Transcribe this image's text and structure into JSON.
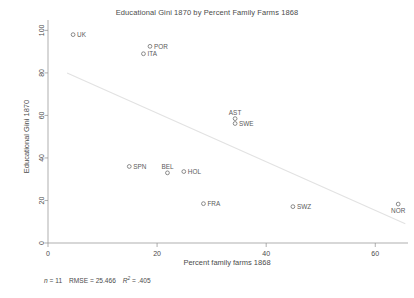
{
  "chart_data": {
    "type": "scatter",
    "title": "Educational Gini 1870 by Percent Family Farms 1868",
    "xlabel": "Percent family farms 1868",
    "ylabel": "Educational Gini 1870",
    "xlim": [
      0,
      66
    ],
    "ylim": [
      0,
      103
    ],
    "xticks": [
      0,
      20,
      40,
      60
    ],
    "yticks": [
      0,
      20,
      40,
      60,
      80,
      100
    ],
    "grid": false,
    "legend": "none",
    "marker": "open-circle",
    "points": [
      {
        "label": "UK",
        "x": 4.6,
        "y": 98.0,
        "label_pos": "right"
      },
      {
        "label": "POR",
        "x": 18.7,
        "y": 92.5,
        "label_pos": "right"
      },
      {
        "label": "ITA",
        "x": 17.5,
        "y": 89.0,
        "label_pos": "right"
      },
      {
        "label": "AST",
        "x": 34.3,
        "y": 58.5,
        "label_pos": "above"
      },
      {
        "label": "SWE",
        "x": 34.3,
        "y": 56.2,
        "label_pos": "right"
      },
      {
        "label": "SPN",
        "x": 14.9,
        "y": 36.0,
        "label_pos": "right"
      },
      {
        "label": "BEL",
        "x": 21.9,
        "y": 33.0,
        "label_pos": "above"
      },
      {
        "label": "HOL",
        "x": 24.9,
        "y": 33.6,
        "label_pos": "right"
      },
      {
        "label": "FRA",
        "x": 28.5,
        "y": 18.5,
        "label_pos": "right"
      },
      {
        "label": "SWZ",
        "x": 44.9,
        "y": 17.1,
        "label_pos": "right"
      },
      {
        "label": "NOR",
        "x": 64.2,
        "y": 18.3,
        "label_pos": "below"
      }
    ],
    "fit_line": {
      "x0": 3.5,
      "y0": 80.0,
      "x1": 65.5,
      "y1": 9.0
    },
    "stats": {
      "n_label": "n",
      "n_value": "= 11",
      "rmse_label": "RMSE",
      "rmse_value": "=  25.466",
      "r2_label": "R",
      "r2_sup": "2",
      "r2_value": "= .405"
    }
  }
}
